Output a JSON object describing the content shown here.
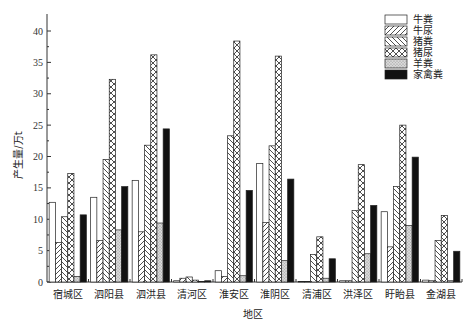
{
  "chart_data": {
    "type": "bar",
    "title": "",
    "xlabel": "地区",
    "ylabel": "产生量/万t",
    "ylim": [
      0,
      42
    ],
    "yticks": [
      0,
      5,
      10,
      15,
      20,
      25,
      30,
      35,
      40
    ],
    "grid": false,
    "legend_position": "top-right",
    "categories": [
      "宿城区",
      "泗阳县",
      "泗洪县",
      "清河区",
      "淮安区",
      "淮阴区",
      "清浦区",
      "洪泽区",
      "盱眙县",
      "金湖县"
    ],
    "series": [
      {
        "name": "牛粪",
        "pattern": "blank",
        "values": [
          12.7,
          13.5,
          16.2,
          0.2,
          1.8,
          18.9,
          0.1,
          0.2,
          11.2,
          0.3
        ]
      },
      {
        "name": "牛尿",
        "pattern": "forward-hatch",
        "values": [
          6.3,
          6.6,
          8.0,
          0.6,
          0.9,
          9.5,
          0.1,
          0.2,
          5.6,
          0.2
        ]
      },
      {
        "name": "猪粪",
        "pattern": "back-hatch",
        "values": [
          10.4,
          19.5,
          21.8,
          0.8,
          23.3,
          21.7,
          4.4,
          11.4,
          15.2,
          6.6
        ]
      },
      {
        "name": "猪尿",
        "pattern": "crosshatch",
        "values": [
          17.3,
          32.3,
          36.2,
          0.3,
          38.4,
          36.0,
          7.2,
          18.7,
          25.0,
          10.6
        ]
      },
      {
        "name": "羊粪",
        "pattern": "dots",
        "values": [
          0.9,
          8.3,
          9.4,
          0.1,
          1.0,
          3.4,
          0.6,
          4.5,
          9.0,
          0.2
        ]
      },
      {
        "name": "家禽粪",
        "pattern": "solid",
        "values": [
          10.7,
          15.2,
          24.4,
          0.2,
          14.6,
          16.4,
          3.7,
          12.2,
          19.9,
          4.9
        ]
      }
    ]
  }
}
